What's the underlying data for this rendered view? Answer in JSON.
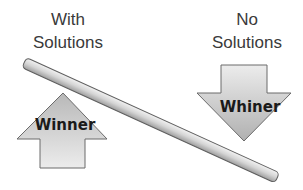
{
  "labels": {
    "left": {
      "line1": "With",
      "line2": "Solutions"
    },
    "right": {
      "line1": "No",
      "line2": "Solutions"
    }
  },
  "arrows": {
    "up": {
      "text": "Winner",
      "direction": "up"
    },
    "down": {
      "text": "Whiner",
      "direction": "down"
    }
  },
  "colors": {
    "arrow_fill_light": "#e6e6e6",
    "arrow_fill_dark": "#bdbdbd",
    "arrow_stroke": "#6b6b6b",
    "bar_light": "#e8e8e8",
    "bar_dark": "#a9a9a9",
    "text": "#3a3a3a"
  }
}
